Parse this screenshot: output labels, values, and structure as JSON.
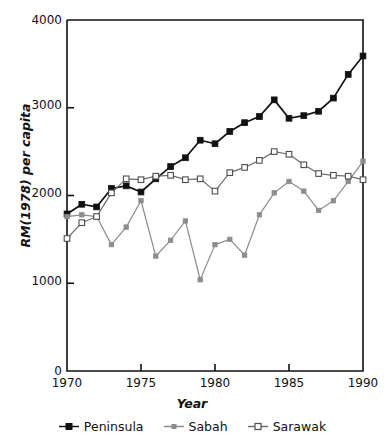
{
  "chart_data": {
    "type": "line",
    "title": "",
    "xlabel": "Year",
    "ylabel": "RM(1978) per capita",
    "xlim": [
      1970,
      1990
    ],
    "ylim": [
      0,
      4000
    ],
    "xticks": [
      1970,
      1975,
      1980,
      1985,
      1990
    ],
    "yticks": [
      0,
      1000,
      2000,
      3000,
      4000
    ],
    "xtick_labels": [
      "1970",
      "1975",
      "1980",
      "1985",
      "1990"
    ],
    "ytick_labels": [
      "0",
      "1000",
      "2000",
      "3000",
      "4000"
    ],
    "grid": false,
    "legend_position": "below",
    "x": [
      1970,
      1971,
      1972,
      1973,
      1974,
      1975,
      1976,
      1977,
      1978,
      1979,
      1980,
      1981,
      1982,
      1983,
      1984,
      1985,
      1986,
      1987,
      1988,
      1989,
      1990
    ],
    "series": [
      {
        "name": "Peninsula",
        "color": "#111111",
        "marker": "filled-square",
        "values": [
          1790,
          1900,
          1870,
          2080,
          2110,
          2040,
          2190,
          2330,
          2430,
          2630,
          2590,
          2730,
          2830,
          2900,
          3090,
          2880,
          2910,
          2960,
          3110,
          3380,
          3590
        ]
      },
      {
        "name": "Sabah",
        "color": "#8c8c8c",
        "marker": "filled-small-square",
        "values": [
          1760,
          1780,
          1760,
          1440,
          1640,
          1940,
          1310,
          1490,
          1710,
          1040,
          1440,
          1500,
          1320,
          1780,
          2030,
          2160,
          2050,
          1830,
          1940,
          2160,
          2390
        ]
      },
      {
        "name": "Sarawak",
        "color": "#6e6e6e",
        "marker": "open-square",
        "values": [
          1510,
          1690,
          1760,
          2030,
          2190,
          2180,
          2220,
          2230,
          2180,
          2190,
          2050,
          2260,
          2320,
          2400,
          2500,
          2470,
          2350,
          2250,
          2230,
          2220,
          2180
        ]
      }
    ]
  },
  "legend": {
    "items": [
      {
        "label": "Peninsula"
      },
      {
        "label": "Sabah"
      },
      {
        "label": "Sarawak"
      }
    ]
  },
  "axis": {
    "frame_color": "#111111"
  }
}
